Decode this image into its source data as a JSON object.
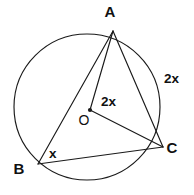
{
  "figure": {
    "background_color": "#ffffff",
    "stroke_color": "#1a1a1a",
    "text_color": "#111111"
  },
  "circle": {
    "center_x": 87,
    "center_y": 107,
    "radius": 73
  },
  "points": {
    "A": {
      "label": "A",
      "x": 113,
      "y": 31,
      "label_x": 110,
      "label_y": 17
    },
    "B": {
      "label": "B",
      "x": 38,
      "y": 164,
      "label_x": 19,
      "label_y": 174
    },
    "C": {
      "label": "C",
      "x": 163,
      "y": 147,
      "label_x": 168,
      "label_y": 153
    },
    "O": {
      "label": "O",
      "x": 90,
      "y": 110,
      "label_x": 79,
      "label_y": 125
    }
  },
  "segments": [
    {
      "name": "chord-AB",
      "from": "A",
      "to": "B"
    },
    {
      "name": "chord-AC",
      "from": "A",
      "to": "C"
    },
    {
      "name": "chord-BC",
      "from": "B",
      "to": "C"
    },
    {
      "name": "radius-OA",
      "from": "O",
      "to": "A"
    },
    {
      "name": "radius-OC",
      "from": "O",
      "to": "C"
    }
  ],
  "annotations": {
    "central_angle": {
      "text": "2x",
      "x": 101,
      "y": 106
    },
    "arc_label": {
      "text": "2x",
      "x": 164,
      "y": 83
    },
    "inscribed_angle": {
      "text": "x",
      "x": 49,
      "y": 158
    }
  }
}
